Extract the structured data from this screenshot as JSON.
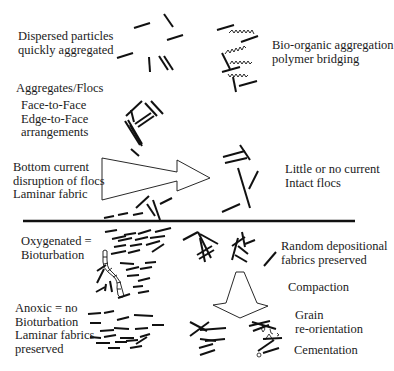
{
  "diagram": {
    "title": "",
    "colors": {
      "ink": "#111111",
      "text": "#1a1a1a",
      "background": "#ffffff"
    },
    "labels": {
      "dispersed": [
        "Dispersed particles",
        "quickly aggregated"
      ],
      "bio_organic": [
        "Bio-organic aggregation",
        "polymer bridging"
      ],
      "aggregates": [
        "Aggregates/Flocs"
      ],
      "face_edge": [
        "Face-to-Face",
        "Edge-to-Face",
        "arrangements"
      ],
      "bottom_current": [
        "Bottom current",
        "disruption of flocs",
        "Laminar fabric"
      ],
      "little_current": [
        "Little or no current",
        "Intact flocs"
      ],
      "oxygenated": [
        "Oxygenated =",
        "Bioturbation"
      ],
      "random_depositional": [
        "Random depositional",
        "fabrics preserved"
      ],
      "anoxic": [
        "Anoxic = no",
        "Bioturbation",
        "Laminar fabrics",
        "preserved"
      ],
      "compaction": [
        "Compaction"
      ],
      "grain_reorientation": [
        "Grain",
        "re-orientation"
      ],
      "cementation": [
        "Cementation"
      ]
    },
    "elements": [
      {
        "name": "dispersed-particles",
        "desc": "scattered short line segments"
      },
      {
        "name": "polymer-bridged-flocs",
        "desc": "line segments joined by wavy polymer strands"
      },
      {
        "name": "floc-aggregates",
        "desc": "face-to-face and edge-to-face stacked segments"
      },
      {
        "name": "current-arrow",
        "desc": "large hollow arrow pointing right"
      },
      {
        "name": "intact-flocs",
        "desc": "card-house arrangement"
      },
      {
        "name": "sediment-water-interface",
        "desc": "thick horizontal line"
      },
      {
        "name": "burrow",
        "desc": "worm burrow through laminae"
      },
      {
        "name": "laminar-fabric",
        "desc": "sub-parallel segments"
      },
      {
        "name": "random-fabric",
        "desc": "random depositional fabric"
      },
      {
        "name": "compaction-arrow",
        "desc": "hollow downward arrow"
      },
      {
        "name": "compacted-grains",
        "desc": "re-oriented grains"
      },
      {
        "name": "cemented-grains",
        "desc": "grains with cement"
      }
    ]
  }
}
